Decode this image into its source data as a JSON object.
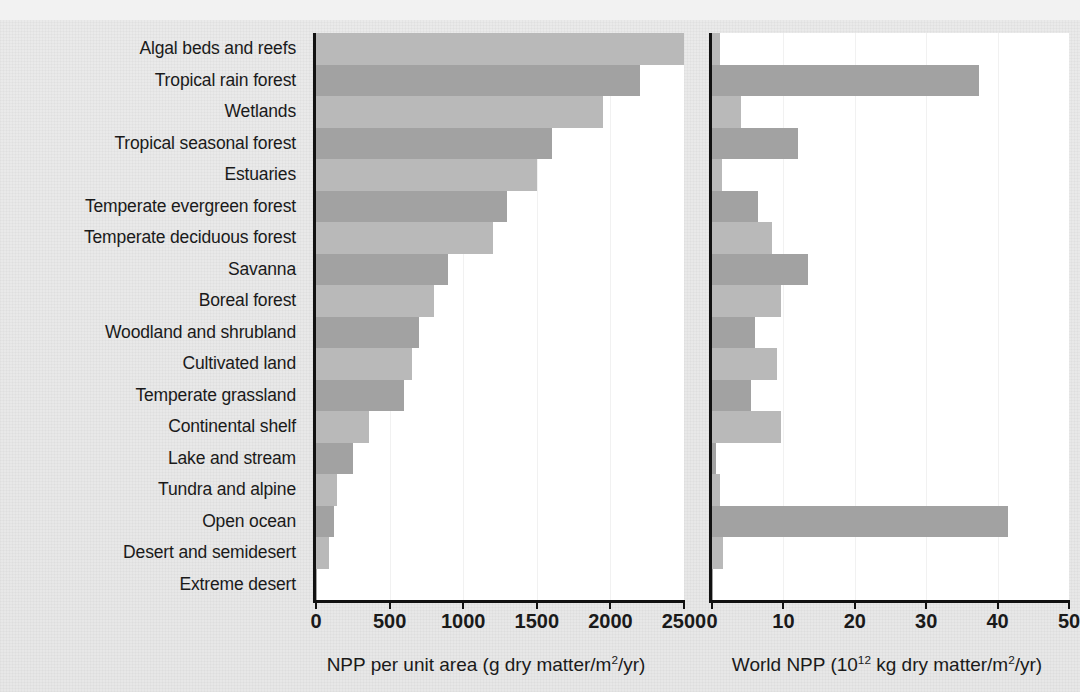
{
  "chart_data": {
    "type": "bar",
    "orientation": "horizontal",
    "title": "",
    "grid": true,
    "legend": null,
    "categories": [
      "Algal beds and reefs",
      "Tropical rain forest",
      "Wetlands",
      "Tropical seasonal forest",
      "Estuaries",
      "Temperate evergreen forest",
      "Temperate deciduous forest",
      "Savanna",
      "Boreal forest",
      "Woodland and shrubland",
      "Cultivated land",
      "Temperate grassland",
      "Continental shelf",
      "Lake and stream",
      "Tundra and alpine",
      "Open ocean",
      "Desert and semidesert",
      "Extreme desert"
    ],
    "panels": [
      {
        "id": "npp-per-unit-area",
        "xlabel": "NPP per unit area (g dry matter/m",
        "xlabel_sup": "2",
        "xlabel_tail": "/yr)",
        "xlim": [
          0,
          2500
        ],
        "ticks": [
          0,
          500,
          1000,
          1500,
          2000,
          2500
        ],
        "tick_labels": [
          "0",
          "500",
          "1000",
          "1500",
          "2000",
          "2500"
        ],
        "values": [
          2500,
          2200,
          1950,
          1600,
          1500,
          1300,
          1200,
          900,
          800,
          700,
          650,
          600,
          360,
          250,
          140,
          125,
          90,
          3
        ]
      },
      {
        "id": "world-npp",
        "xlabel": "World NPP (10",
        "xlabel_sup": "12",
        "xlabel_tail": " kg dry matter/m",
        "xlabel_sup2": "2",
        "xlabel_tail2": "/yr)",
        "xlim": [
          0,
          50
        ],
        "ticks": [
          0,
          10,
          20,
          30,
          40,
          50
        ],
        "tick_labels": [
          "0",
          "10",
          "20",
          "30",
          "40",
          "50"
        ],
        "values": [
          1.1,
          37.4,
          4.0,
          12.0,
          1.4,
          6.5,
          8.4,
          13.5,
          9.6,
          6.0,
          9.1,
          5.4,
          9.6,
          0.5,
          1.1,
          41.5,
          1.6,
          0.07
        ]
      }
    ],
    "bar_shading_alternates": true,
    "colors": {
      "bar_light": "#b9b9b9",
      "bar_dark": "#a2a2a2",
      "axis": "#111111",
      "plot_background": "#ffffff",
      "page_background": "#e9e9e9",
      "gridline": "#f1f1f1"
    }
  }
}
